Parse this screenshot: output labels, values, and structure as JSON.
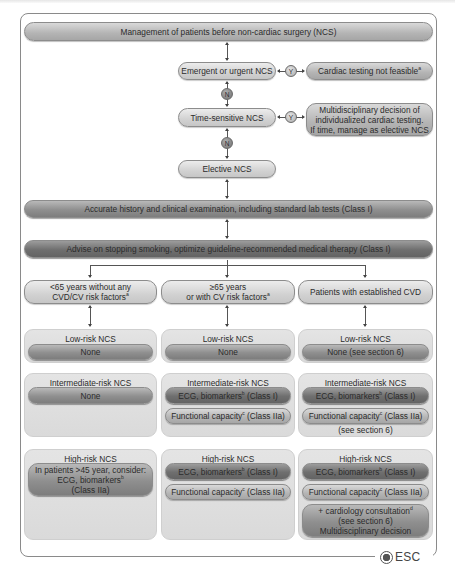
{
  "title": "Management of patients before non-cardiac surgery (NCS)",
  "decision_nodes": {
    "emergent": "Emergent or urgent NCS",
    "time_sensitive": "Time-sensitive NCS",
    "elective": "Elective NCS"
  },
  "yes_label": "Y",
  "no_label": "N",
  "outcomes": {
    "cardiac_testing": "Cardiac testing not feasible",
    "cardiac_testing_sup": "a",
    "multidisciplinary_line1": "Multidisciplinary decision of",
    "multidisciplinary_line2": "individualized cardiac testing.",
    "multidisciplinary_line3": "If time, manage as elective NCS"
  },
  "steps": {
    "history": "Accurate history and clinical examination, including standard lab tests (Class I)",
    "advise": "Advise on stopping smoking, optimize guideline-recommended medical therapy (Class I)"
  },
  "columns": [
    {
      "header_line1": "<65 years without any",
      "header_line2": "CVD/CV risk factors",
      "header_sup": "a",
      "low_risk": {
        "title": "Low-risk NCS",
        "items": [
          "None"
        ]
      },
      "intermediate_risk": {
        "title": "Intermediate-risk NCS",
        "items": [
          "None"
        ]
      },
      "high_risk": {
        "title": "High-risk NCS",
        "line1": "In patients >45 year, consider:",
        "line2": "ECG, biomarkers",
        "line2_sup": "b",
        "line3": "(Class IIa)"
      }
    },
    {
      "header_line1": "≥65 years",
      "header_line2": "or with CV risk factors",
      "header_sup": "a",
      "low_risk": {
        "title": "Low-risk NCS",
        "items": [
          "None"
        ]
      },
      "intermediate_risk": {
        "title": "Intermediate-risk NCS",
        "ecg": "ECG, biomarkers",
        "ecg_sup": "b",
        "ecg_class": " (Class I)",
        "func": "Functional capacity",
        "func_sup": "c",
        "func_class": " (Class IIa)"
      },
      "high_risk": {
        "title": "High-risk NCS",
        "ecg": "ECG, biomarkers",
        "ecg_sup": "b",
        "ecg_class": " (Class I)",
        "func": "Functional capacity",
        "func_sup": "c",
        "func_class": " (Class IIa)"
      }
    },
    {
      "header_line1": "Patients with established CVD",
      "low_risk": {
        "title": "Low-risk NCS",
        "items": [
          "None (see section 6)"
        ]
      },
      "intermediate_risk": {
        "title": "Intermediate-risk NCS",
        "ecg": "ECG, biomarkers",
        "ecg_sup": "b",
        "ecg_class": " (Class I)",
        "func": "Functional capacity",
        "func_sup": "c",
        "func_class": " (Class IIa)",
        "note": "(see section 6)"
      },
      "high_risk": {
        "title": "High-risk NCS",
        "ecg": "ECG, biomarkers",
        "ecg_sup": "b",
        "ecg_class": " (Class I)",
        "func": "Functional capacity",
        "func_sup": "c",
        "func_class": " (Class IIa)",
        "consult_line1": "+ cardiology consultation",
        "consult_sup": "d",
        "consult_line2": "(see section 6)",
        "consult_line3": "Multidisciplinary decision"
      }
    }
  ],
  "logo": {
    "text": "ESC"
  }
}
